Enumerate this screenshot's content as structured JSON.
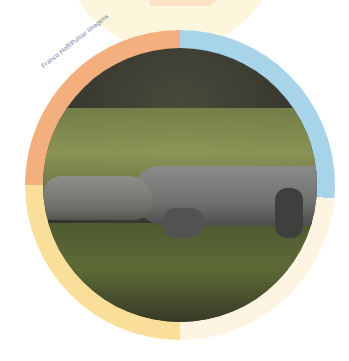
{
  "image": {
    "subject": "caiman resting in grass",
    "alt": "Caiman lying on grassy ground, circular crop"
  },
  "credit": {
    "text": "Franco Hoff/Pulsar Imagens"
  },
  "ring": {
    "segments": [
      {
        "name": "top-right",
        "color": "#a8d4ea"
      },
      {
        "name": "bottom-right",
        "color": "#fdf5e2"
      },
      {
        "name": "bottom-left",
        "color": "#f9df9a"
      },
      {
        "name": "top-left",
        "color": "#f3b07e"
      }
    ]
  }
}
